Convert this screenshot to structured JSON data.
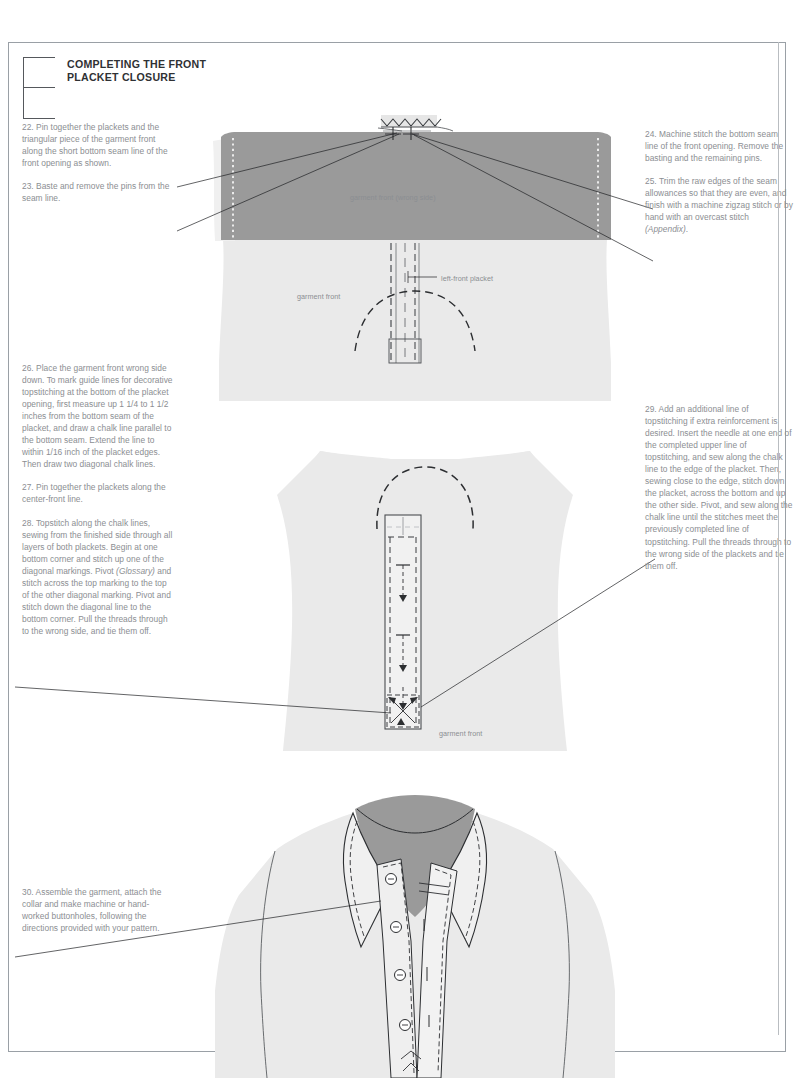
{
  "page": {
    "section_title": "COMPLETING THE FRONT\nPLACKET CLOSURE",
    "background_color": "#ffffff",
    "border_color": "#9aa0a6",
    "body_text_color": "#8b8e92",
    "heading_color": "#2f3134",
    "fabric_dark_color": "#9a9a9a",
    "fabric_light_color": "#eaeaea",
    "line_color": "#1f2124"
  },
  "steps": {
    "left_top": [
      "22. Pin together the plackets and the triangular piece of the garment front along the short bottom seam line of the front opening as shown.",
      "23. Baste and remove the pins from the seam line."
    ],
    "right_top": [
      "24. Machine stitch the bottom seam line of the front opening. Remove the basting and the remaining pins.",
      "25. Trim the raw edges of the seam allowances so that they are even, and finish with a machine zigzag stitch or by hand with an overcast stitch "
    ],
    "step25_italic": "(Appendix)",
    "step25_tail": ".",
    "left_mid": [
      "26. Place the garment front wrong side down. To mark guide lines for decorative topstitching at the bottom of the placket opening, first measure up 1 1/4 to 1 1/2 inches from the bottom seam of the placket, and draw a chalk line parallel to the bottom seam. Extend the line to within 1/16 inch of the placket edges. Then draw two diagonal chalk lines.",
      "27. Pin together the plackets along the center-front line."
    ],
    "step28_part1": "28. Topstitch along the chalk lines, sewing from the finished side through all layers of both plackets. Begin at one bottom corner and stitch up one of the diagonal markings. Pivot ",
    "step28_italic": "(Glossary)",
    "step28_part2": " and stitch across the top marking to the top of the other diagonal marking. Pivot and stitch down the diagonal line to the bottom corner. Pull the threads through to the wrong side, and tie them off.",
    "right_mid": [
      "29. Add an additional line of topstitching if extra reinforcement is desired. Insert the needle at one end of the completed upper line of topstitching, and sew along the chalk line to the edge of the placket. Then, sewing close to the edge, stitch down the placket, across the bottom and up the other side. Pivot, and sew along the chalk line until the stitches meet the previously completed line of topstitching. Pull the threads through to the wrong side of the plackets and tie them off."
    ],
    "left_bottom": [
      "30. Assemble the garment, attach the collar and make machine or hand-worked buttonholes, following the directions provided with your pattern."
    ]
  },
  "figures": {
    "figure1": {
      "name": "pinned-placket-wrong-side",
      "labels": {
        "wrong_side": "garment front (wrong side)",
        "garment_front": "garment front",
        "left_front_placket": "left-front placket"
      }
    },
    "figure2": {
      "name": "topstitched-placket",
      "labels": {
        "garment_front": "garment front"
      }
    },
    "figure3": {
      "name": "finished-shirt-with-collar",
      "labels": {}
    }
  }
}
